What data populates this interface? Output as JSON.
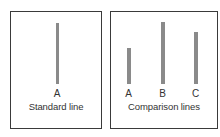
{
  "panels": {
    "standard": {
      "caption": "Standard line",
      "lines": [
        {
          "label": "A",
          "length_px": 61
        }
      ]
    },
    "comparison": {
      "caption": "Comparison lines",
      "lines": [
        {
          "label": "A",
          "length_px": 36
        },
        {
          "label": "B",
          "length_px": 62
        },
        {
          "label": "C",
          "length_px": 52
        }
      ]
    }
  },
  "colors": {
    "line": "#8a8a8a",
    "border": "#3a3a3a",
    "text": "#333333"
  }
}
